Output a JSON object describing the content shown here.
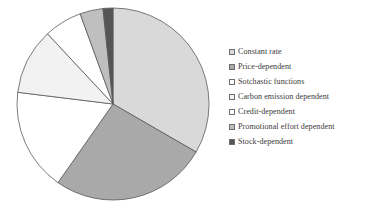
{
  "chart_data": {
    "type": "pie",
    "title": "",
    "subtitle": "",
    "xlabel": "",
    "ylabel": "",
    "grid": false,
    "legend_position": "right",
    "start_angle_deg": 0,
    "direction": "clockwise",
    "center": {
      "x": 113,
      "y": 104
    },
    "radius": 96,
    "categories": [
      "Constant rate",
      "Price-dependent",
      "Sotchastic functions",
      "Carbon emission dependent",
      "Credit-dependent",
      "Promotional effort dependent",
      "Stock-dependent"
    ],
    "values": [
      120,
      95,
      62,
      40,
      23,
      14,
      6
    ],
    "percentages": [
      33.3,
      26.4,
      17.2,
      11.1,
      6.4,
      3.9,
      1.7
    ],
    "colors": [
      "#d9d9d9",
      "#a9a9a9",
      "#ffffff",
      "#f2f2f2",
      "#ffffff",
      "#bfbfbf",
      "#555555"
    ],
    "slice_edge_color": "#5a5a5a",
    "slice_edge_width": 0.8
  },
  "legend": {
    "items": [
      {
        "label": "Constant rate",
        "color": "#d9d9d9"
      },
      {
        "label": "Price-dependent",
        "color": "#a9a9a9"
      },
      {
        "label": "Sotchastic functions",
        "color": "#ffffff"
      },
      {
        "label": "Carbon emission dependent",
        "color": "#f2f2f2"
      },
      {
        "label": "Credit-dependent",
        "color": "#ffffff"
      },
      {
        "label": "Promotional effort dependent",
        "color": "#bfbfbf"
      },
      {
        "label": "Stock-dependent",
        "color": "#555555"
      }
    ]
  }
}
